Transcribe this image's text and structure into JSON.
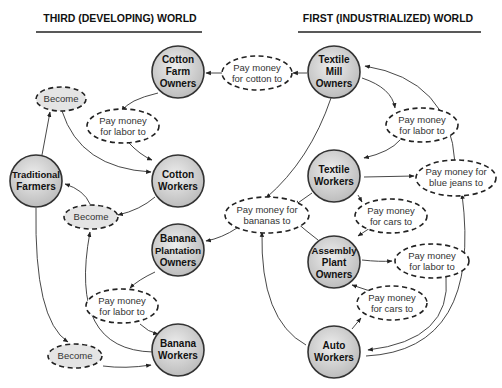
{
  "titles": {
    "left": "THIRD (DEVELOPING) WORLD",
    "right": "FIRST (INDUSTRIALIZED) WORLD"
  },
  "nodes": {
    "cotton_farm_owners": [
      "Cotton",
      "Farm",
      "Owners"
    ],
    "textile_mill_owners": [
      "Textile",
      "Mill",
      "Owners"
    ],
    "traditional_farmers": [
      "Traditional",
      "Farmers"
    ],
    "cotton_workers": [
      "Cotton",
      "Workers"
    ],
    "textile_workers": [
      "Textile",
      "Workers"
    ],
    "banana_plantation_owners": [
      "Banana",
      "Plantation",
      "Owners"
    ],
    "assembly_plant_owners": [
      "Assembly",
      "Plant",
      "Owners"
    ],
    "banana_workers": [
      "Banana",
      "Workers"
    ],
    "auto_workers": [
      "Auto",
      "Workers"
    ]
  },
  "relations": {
    "become_top": [
      "Become"
    ],
    "labor_top_left": [
      "Pay money",
      "for labor to"
    ],
    "cotton": [
      "Pay money",
      "for cotton to"
    ],
    "labor_top_right": [
      "Pay money",
      "for labor to"
    ],
    "become_mid": [
      "Become"
    ],
    "blue_jeans": [
      "Pay money for",
      "blue jeans to"
    ],
    "bananas": [
      "Pay money for",
      "bananas to"
    ],
    "cars_upper": [
      "Pay money",
      "for cars to"
    ],
    "labor_lower_right": [
      "Pay money",
      "for labor to"
    ],
    "labor_bottom_left": [
      "Pay money",
      "for labor to"
    ],
    "cars_lower": [
      "Pay money",
      "for cars to"
    ],
    "become_bottom": [
      "Become"
    ]
  }
}
